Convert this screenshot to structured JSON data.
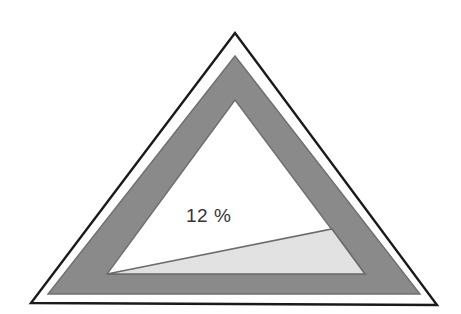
{
  "figure": {
    "background_color": "#ffffff",
    "label": "12 %",
    "label_color": "#353535",
    "outline_color": "#1a1a1a",
    "band_color": "#8a8a8a",
    "band_edge_color": "#6f6f6f",
    "wedge_color": "#e2e2e2",
    "wedge_edge_color": "#6b6b6b",
    "inner_fill_color": "#ffffff"
  },
  "chart_data": {
    "type": "pie",
    "title": "",
    "subtitle": "",
    "xlabel": "",
    "ylabel": "",
    "categories": [
      "Shaded wedge",
      "Remaining area"
    ],
    "values": [
      12,
      88
    ],
    "value_unit": "%",
    "data_labels": [
      "12 %",
      ""
    ],
    "annotations": [
      "12 %"
    ],
    "legend": [],
    "legend_position": "none",
    "grid": false,
    "colors": [
      "#e2e2e2",
      "#ffffff"
    ],
    "shape": "triangle",
    "geometry": {
      "outer_outline_triangle": [
        [
          235,
          33
        ],
        [
          31,
          303
        ],
        [
          437,
          305
        ]
      ],
      "gray_band_outer_triangle": [
        [
          235,
          56
        ],
        [
          48,
          294
        ],
        [
          420,
          294
        ]
      ],
      "gray_band_inner_triangle": [
        [
          235,
          100
        ],
        [
          107,
          274
        ],
        [
          365,
          274
        ]
      ],
      "wedge_triangle": [
        [
          107,
          274
        ],
        [
          365,
          274
        ],
        [
          332,
          229
        ]
      ]
    }
  }
}
